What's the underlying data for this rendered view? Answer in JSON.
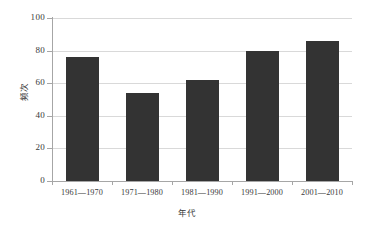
{
  "chart_data": {
    "type": "bar",
    "title": "",
    "subtitle": "",
    "xlabel": "年代",
    "ylabel": "频次",
    "categories": [
      "1961—1970",
      "1971—1980",
      "1981—1990",
      "1991—2000",
      "2001—2010"
    ],
    "values": [
      76,
      54,
      62,
      80,
      86
    ],
    "series": [
      {
        "name": "频次",
        "values": [
          76,
          54,
          62,
          80,
          86
        ]
      }
    ],
    "ylim": [
      0,
      100
    ],
    "yticks": [
      0,
      20,
      40,
      60,
      80,
      100
    ],
    "ytick_labels": [
      "0",
      "20",
      "40",
      "60",
      "80",
      "100"
    ],
    "grid": true,
    "grid_axis": "y",
    "legend": false,
    "legend_position": "none",
    "bar_color": "#333333",
    "grid_color": "#d9d9d9",
    "axis_color": "#a6a6a6",
    "background_color": "#ffffff",
    "text_color": "#3a3a3a"
  }
}
